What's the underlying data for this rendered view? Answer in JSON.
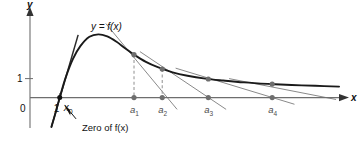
{
  "figure": {
    "background_color": "#ffffff",
    "curve_color": "#1a1a1a",
    "tangent_color": "#8a8a8a",
    "axis_color": "#6e6e6e",
    "point_color": "#6e6e6e",
    "root_point_color": "#111111",
    "dashed_color": "#9a9a9a"
  },
  "axes": {
    "y_label": "y",
    "x_label": "x",
    "origin_label": "0",
    "x_tick_label": "1",
    "y_tick_label": "1"
  },
  "curve": {
    "label": "y = f(x)"
  },
  "annotations": {
    "root_label": "x₀",
    "root_label_text": "x",
    "root_label_sub": "0",
    "note": "Zero of f(x)"
  },
  "chart_data": {
    "type": "line",
    "title": "",
    "subtitle": "",
    "xlabel": "x",
    "ylabel": "y",
    "grid": false,
    "legend_position": "none",
    "xlim": [
      0,
      10.6
    ],
    "ylim": [
      -1.6,
      4.4
    ],
    "series": [
      {
        "name": "y = f(x)",
        "role": "function-curve",
        "color": "#1a1a1a",
        "x": [
          0.72,
          0.85,
          1.0,
          1.2,
          1.45,
          1.7,
          2.0,
          2.3,
          2.6,
          2.9,
          3.2,
          3.5,
          3.9,
          4.3,
          4.8,
          5.3,
          5.9,
          6.5,
          7.2,
          8.0,
          8.8,
          9.6,
          10.4
        ],
        "y": [
          -1.55,
          -0.85,
          0.0,
          1.05,
          2.05,
          2.72,
          3.2,
          3.33,
          3.22,
          2.95,
          2.6,
          2.26,
          1.88,
          1.6,
          1.33,
          1.15,
          1.0,
          0.9,
          0.8,
          0.72,
          0.66,
          0.62,
          0.58
        ]
      }
    ],
    "annotations": [
      {
        "text": "y = f(x)",
        "x": 2.05,
        "y": 4.0,
        "name": "curve-label"
      },
      {
        "text": "Zero of f(x)",
        "x": 1.75,
        "y": -1.35,
        "name": "zero-note"
      }
    ],
    "points": [
      {
        "name": "root",
        "label": "x₀",
        "x": 1.0,
        "y": 0.0,
        "on": "axis",
        "color": "#111111"
      },
      {
        "name": "curve-point-1",
        "x": 3.5,
        "y": 2.26,
        "on": "curve",
        "color": "#6e6e6e"
      },
      {
        "name": "axis-point-a1",
        "label": "a₁",
        "x": 3.5,
        "y": 0.0,
        "on": "axis",
        "color": "#6e6e6e"
      },
      {
        "name": "curve-point-2",
        "x": 4.45,
        "y": 1.5,
        "on": "curve",
        "color": "#6e6e6e"
      },
      {
        "name": "axis-point-a2",
        "label": "a₂",
        "x": 4.45,
        "y": 0.0,
        "on": "axis",
        "color": "#6e6e6e"
      },
      {
        "name": "curve-point-3",
        "x": 6.0,
        "y": 0.98,
        "on": "curve",
        "color": "#6e6e6e"
      },
      {
        "name": "axis-point-a3",
        "label": "a₃",
        "x": 6.0,
        "y": 0.0,
        "on": "axis",
        "color": "#6e6e6e"
      },
      {
        "name": "curve-point-4",
        "x": 8.15,
        "y": 0.71,
        "on": "curve",
        "color": "#6e6e6e"
      },
      {
        "name": "axis-point-a4",
        "label": "a₄",
        "x": 8.15,
        "y": 0.0,
        "on": "axis",
        "color": "#6e6e6e"
      }
    ],
    "iterates": [
      {
        "label": "a₁",
        "x": 3.5
      },
      {
        "label": "a₂",
        "x": 4.45
      },
      {
        "label": "a₃",
        "x": 6.0
      },
      {
        "label": "a₄",
        "x": 8.15
      }
    ],
    "tangent_lines": [
      {
        "name": "tangent-at-a1",
        "from_x": 2.55,
        "from_y": 3.9,
        "to_x": 4.95,
        "to_y": -0.62
      },
      {
        "name": "tangent-at-a2",
        "from_x": 3.7,
        "from_y": 2.42,
        "to_x": 6.6,
        "to_y": -0.62
      },
      {
        "name": "tangent-at-a3",
        "from_x": 4.9,
        "from_y": 1.55,
        "to_x": 8.9,
        "to_y": -0.35
      },
      {
        "name": "tangent-at-a4",
        "from_x": 6.7,
        "from_y": 1.0,
        "to_x": 10.3,
        "to_y": -0.1
      },
      {
        "name": "tangent-at-root",
        "from_x": 0.72,
        "from_y": -1.55,
        "to_x": 1.62,
        "to_y": 3.3
      }
    ],
    "dashed_drops": [
      {
        "name": "drop-a1",
        "x": 3.5,
        "y_top": 2.26,
        "y_bottom": 0.0
      },
      {
        "name": "drop-a2",
        "x": 4.45,
        "y_top": 1.5,
        "y_bottom": 0.0
      }
    ],
    "ticks": {
      "x": [
        {
          "value": 1.0,
          "label": "1"
        }
      ],
      "y": [
        {
          "value": 1.0,
          "label": "1"
        }
      ]
    }
  }
}
